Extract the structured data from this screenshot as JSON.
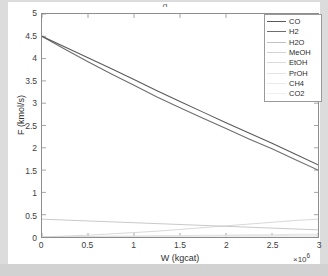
{
  "figure": {
    "background": "#ffffff",
    "outer_background": "#d8d8d8",
    "title_remnant": "g"
  },
  "chart_data": {
    "type": "line",
    "title": "",
    "xlabel": "W (kgcat)",
    "ylabel": "F (kmol/s)",
    "x_exponent_text": "×10",
    "x_exponent_sup": "6",
    "xlim": [
      0,
      3
    ],
    "ylim": [
      0,
      5
    ],
    "xticks": [
      "0",
      "0.5",
      "1",
      "1.5",
      "2",
      "2.5",
      "3"
    ],
    "xtick_values": [
      0,
      0.5,
      1,
      1.5,
      2,
      2.5,
      3
    ],
    "yticks": [
      "0",
      "0.5",
      "1",
      "1.5",
      "2",
      "2.5",
      "3",
      "3.5",
      "4",
      "4.5",
      "5"
    ],
    "ytick_values": [
      0,
      0.5,
      1,
      1.5,
      2,
      2.5,
      3,
      3.5,
      4,
      4.5,
      5
    ],
    "grid": false,
    "legend_position": "top-right",
    "x": [
      0,
      0.25,
      0.5,
      0.75,
      1,
      1.25,
      1.5,
      1.75,
      2,
      2.25,
      2.5,
      2.75,
      3
    ],
    "series": [
      {
        "name": "CO",
        "color": "#5a5a5a",
        "width": 1.1,
        "values": [
          4.5,
          4.26,
          4.02,
          3.78,
          3.53,
          3.28,
          3.04,
          2.8,
          2.56,
          2.33,
          2.1,
          1.86,
          1.62
        ]
      },
      {
        "name": "H2",
        "color": "#6e6e6e",
        "width": 1.1,
        "values": [
          4.5,
          4.21,
          3.93,
          3.66,
          3.4,
          3.14,
          2.9,
          2.66,
          2.43,
          2.2,
          1.98,
          1.74,
          1.5
        ]
      },
      {
        "name": "H2O",
        "color": "#c2c2c2",
        "width": 0.9,
        "values": [
          0.4,
          0.38,
          0.36,
          0.34,
          0.32,
          0.3,
          0.28,
          0.26,
          0.24,
          0.22,
          0.2,
          0.18,
          0.16
        ]
      },
      {
        "name": "MeOH",
        "color": "#d3d3d3",
        "width": 0.9,
        "values": [
          0.0,
          0.02,
          0.04,
          0.07,
          0.1,
          0.13,
          0.17,
          0.21,
          0.25,
          0.29,
          0.33,
          0.37,
          0.4
        ]
      },
      {
        "name": "EtOH",
        "color": "#dcdcdc",
        "width": 0.8,
        "values": [
          0.0,
          0.01,
          0.01,
          0.02,
          0.02,
          0.03,
          0.03,
          0.04,
          0.04,
          0.05,
          0.05,
          0.06,
          0.06
        ]
      },
      {
        "name": "PrOH",
        "color": "#e4e4e4",
        "width": 0.8,
        "values": [
          0.0,
          0.0,
          0.01,
          0.01,
          0.01,
          0.02,
          0.02,
          0.02,
          0.03,
          0.03,
          0.03,
          0.04,
          0.04
        ]
      },
      {
        "name": "CH4",
        "color": "#eaeaea",
        "width": 0.8,
        "values": [
          0.0,
          0.0,
          0.0,
          0.01,
          0.01,
          0.01,
          0.01,
          0.01,
          0.02,
          0.02,
          0.02,
          0.02,
          0.02
        ]
      },
      {
        "name": "CO2",
        "color": "#f0f0f0",
        "width": 0.8,
        "values": [
          0.0,
          0.0,
          0.0,
          0.0,
          0.0,
          0.0,
          0.01,
          0.01,
          0.01,
          0.01,
          0.01,
          0.01,
          0.01
        ]
      }
    ]
  }
}
